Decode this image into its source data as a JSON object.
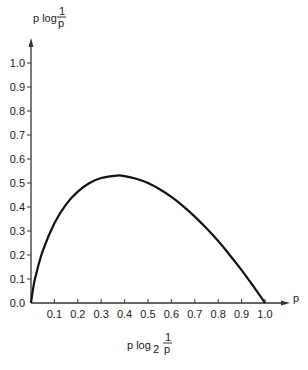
{
  "chart_data": {
    "type": "line",
    "title": "",
    "function": "p log2(1/p)",
    "ylabel": {
      "prefix": "p log",
      "subscript": "",
      "frac_num": "1",
      "frac_den": "p"
    },
    "xlabel_axis": "p",
    "caption": {
      "prefix": "p log",
      "subscript": "2",
      "frac_num": "1",
      "frac_den": "p"
    },
    "xlim": [
      0,
      1.0
    ],
    "ylim": [
      0,
      1.0
    ],
    "grid": false,
    "x_ticks": [
      "0.1",
      "0.2",
      "0.3",
      "0.4",
      "0.5",
      "0.6",
      "0.7",
      "0.8",
      "0.9",
      "1.0"
    ],
    "y_ticks": [
      "0.0",
      "0.1",
      "0.2",
      "0.3",
      "0.4",
      "0.5",
      "0.6",
      "0.7",
      "0.8",
      "0.9",
      "1.0"
    ],
    "series": [
      {
        "name": "p log2(1/p)",
        "x": [
          0.0,
          0.01,
          0.02,
          0.05,
          0.1,
          0.15,
          0.2,
          0.25,
          0.3,
          0.368,
          0.4,
          0.45,
          0.5,
          0.55,
          0.6,
          0.65,
          0.7,
          0.75,
          0.8,
          0.85,
          0.9,
          0.95,
          1.0
        ],
        "values": [
          0.0,
          0.066,
          0.113,
          0.216,
          0.332,
          0.411,
          0.464,
          0.5,
          0.521,
          0.531,
          0.529,
          0.518,
          0.5,
          0.474,
          0.442,
          0.404,
          0.36,
          0.311,
          0.258,
          0.199,
          0.137,
          0.07,
          0.0
        ]
      }
    ]
  }
}
